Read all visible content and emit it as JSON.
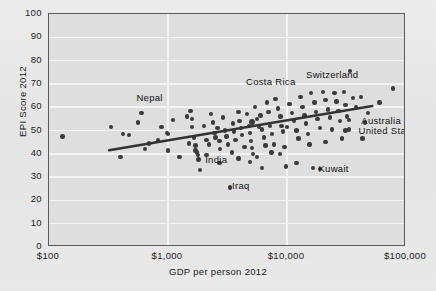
{
  "chart_data": {
    "type": "scatter",
    "title": "",
    "xlabel": "GDP per person 2012",
    "ylabel": "EPI Score 2012",
    "xscale": "log",
    "xlim": [
      100,
      100000
    ],
    "ylim": [
      0,
      100
    ],
    "grid": true,
    "legend": "none",
    "xticks": [
      "$100",
      "$1,000",
      "$10,000",
      "$100,000"
    ],
    "xtick_values": [
      100,
      1000,
      10000,
      100000
    ],
    "yticks": [
      "0",
      "10",
      "20",
      "30",
      "40",
      "50",
      "60",
      "70",
      "80",
      "90",
      "100"
    ],
    "ytick_values": [
      0,
      10,
      20,
      30,
      40,
      50,
      60,
      70,
      80,
      90,
      100
    ],
    "trendline": {
      "x": [
        320,
        52000
      ],
      "y": [
        41.5,
        60.5
      ]
    },
    "annotations": [
      {
        "label": "Nepal",
        "x": 700,
        "y": 64,
        "align": "center"
      },
      {
        "label": "Costa Rica",
        "x": 7300,
        "y": 71,
        "align": "center"
      },
      {
        "label": "Switzerland",
        "x": 24000,
        "y": 74,
        "align": "center"
      },
      {
        "label": "Australia",
        "x": 39000,
        "y": 54,
        "align": "left"
      },
      {
        "label": "United States",
        "x": 37000,
        "y": 50,
        "align": "left"
      },
      {
        "label": "India",
        "x": 1900,
        "y": 37.5,
        "align": "left"
      },
      {
        "label": "Iraq",
        "x": 3200,
        "y": 26,
        "align": "left"
      },
      {
        "label": "Kuwait",
        "x": 17000,
        "y": 33.5,
        "align": "left"
      }
    ],
    "points": [
      {
        "x": 130,
        "y": 47.5
      },
      {
        "x": 330,
        "y": 51.5
      },
      {
        "x": 420,
        "y": 48.5
      },
      {
        "x": 470,
        "y": 48.0
      },
      {
        "x": 560,
        "y": 53.5
      },
      {
        "x": 600,
        "y": 57.5
      },
      {
        "x": 400,
        "y": 38.5
      },
      {
        "x": 640,
        "y": 42.0
      },
      {
        "x": 690,
        "y": 44.5
      },
      {
        "x": 880,
        "y": 51.5
      },
      {
        "x": 980,
        "y": 49.0
      },
      {
        "x": 1000,
        "y": 48.5
      },
      {
        "x": 1000,
        "y": 41.5
      },
      {
        "x": 1100,
        "y": 54.5
      },
      {
        "x": 1250,
        "y": 38.5
      },
      {
        "x": 1500,
        "y": 44.5
      },
      {
        "x": 1550,
        "y": 58.5
      },
      {
        "x": 1600,
        "y": 55.0
      },
      {
        "x": 1600,
        "y": 51.5
      },
      {
        "x": 1650,
        "y": 47.0
      },
      {
        "x": 1700,
        "y": 43.5
      },
      {
        "x": 1700,
        "y": 41.5
      },
      {
        "x": 1750,
        "y": 40.5
      },
      {
        "x": 1780,
        "y": 39.5
      },
      {
        "x": 1800,
        "y": 37.5
      },
      {
        "x": 1850,
        "y": 33.0
      },
      {
        "x": 2000,
        "y": 52.0
      },
      {
        "x": 2100,
        "y": 46.0
      },
      {
        "x": 2200,
        "y": 44.0
      },
      {
        "x": 2300,
        "y": 57.0
      },
      {
        "x": 2400,
        "y": 53.5
      },
      {
        "x": 2450,
        "y": 49.0
      },
      {
        "x": 2500,
        "y": 47.0
      },
      {
        "x": 2600,
        "y": 51.0
      },
      {
        "x": 2700,
        "y": 45.5
      },
      {
        "x": 2750,
        "y": 42.0
      },
      {
        "x": 2900,
        "y": 55.5
      },
      {
        "x": 3000,
        "y": 50.0
      },
      {
        "x": 3100,
        "y": 47.5
      },
      {
        "x": 3200,
        "y": 44.0
      },
      {
        "x": 3300,
        "y": 25.5
      },
      {
        "x": 3500,
        "y": 53.0
      },
      {
        "x": 3600,
        "y": 49.5
      },
      {
        "x": 3700,
        "y": 46.0
      },
      {
        "x": 3900,
        "y": 58.0
      },
      {
        "x": 4000,
        "y": 54.0
      },
      {
        "x": 4100,
        "y": 51.0
      },
      {
        "x": 4200,
        "y": 48.0
      },
      {
        "x": 4400,
        "y": 43.0
      },
      {
        "x": 4600,
        "y": 57.0
      },
      {
        "x": 4800,
        "y": 52.0
      },
      {
        "x": 4900,
        "y": 49.0
      },
      {
        "x": 5000,
        "y": 45.5
      },
      {
        "x": 5200,
        "y": 40.0
      },
      {
        "x": 5400,
        "y": 60.0
      },
      {
        "x": 5600,
        "y": 55.0
      },
      {
        "x": 5800,
        "y": 51.5
      },
      {
        "x": 6000,
        "y": 56.5
      },
      {
        "x": 6200,
        "y": 50.5
      },
      {
        "x": 6400,
        "y": 47.0
      },
      {
        "x": 6600,
        "y": 43.5
      },
      {
        "x": 6800,
        "y": 62.0
      },
      {
        "x": 7000,
        "y": 58.0
      },
      {
        "x": 7200,
        "y": 52.0
      },
      {
        "x": 7500,
        "y": 48.5
      },
      {
        "x": 7800,
        "y": 44.0
      },
      {
        "x": 8000,
        "y": 63.5
      },
      {
        "x": 8400,
        "y": 59.5
      },
      {
        "x": 8800,
        "y": 56.0
      },
      {
        "x": 9000,
        "y": 52.0
      },
      {
        "x": 9200,
        "y": 49.5
      },
      {
        "x": 9500,
        "y": 43.0
      },
      {
        "x": 10000,
        "y": 51.5
      },
      {
        "x": 10500,
        "y": 61.5
      },
      {
        "x": 11000,
        "y": 57.5
      },
      {
        "x": 11500,
        "y": 54.0
      },
      {
        "x": 12000,
        "y": 50.0
      },
      {
        "x": 12500,
        "y": 46.5
      },
      {
        "x": 13000,
        "y": 64.5
      },
      {
        "x": 13500,
        "y": 60.0
      },
      {
        "x": 14000,
        "y": 56.5
      },
      {
        "x": 14500,
        "y": 53.0
      },
      {
        "x": 15000,
        "y": 48.5
      },
      {
        "x": 15500,
        "y": 44.0
      },
      {
        "x": 16000,
        "y": 66.0
      },
      {
        "x": 17000,
        "y": 62.0
      },
      {
        "x": 17500,
        "y": 58.0
      },
      {
        "x": 18000,
        "y": 55.0
      },
      {
        "x": 19000,
        "y": 51.0
      },
      {
        "x": 20000,
        "y": 66.5
      },
      {
        "x": 21000,
        "y": 63.0
      },
      {
        "x": 22000,
        "y": 59.0
      },
      {
        "x": 23000,
        "y": 55.5
      },
      {
        "x": 24000,
        "y": 50.5
      },
      {
        "x": 25000,
        "y": 66.0
      },
      {
        "x": 26000,
        "y": 62.5
      },
      {
        "x": 27000,
        "y": 58.5
      },
      {
        "x": 28000,
        "y": 54.0
      },
      {
        "x": 30000,
        "y": 66.5
      },
      {
        "x": 31000,
        "y": 61.0
      },
      {
        "x": 32000,
        "y": 56.0
      },
      {
        "x": 33000,
        "y": 50.5
      },
      {
        "x": 34000,
        "y": 75.5
      },
      {
        "x": 36000,
        "y": 64.0
      },
      {
        "x": 38000,
        "y": 60.0
      },
      {
        "x": 42000,
        "y": 64.5
      },
      {
        "x": 45000,
        "y": 53.5
      },
      {
        "x": 48000,
        "y": 57.5
      },
      {
        "x": 60000,
        "y": 62.0
      },
      {
        "x": 78000,
        "y": 68.0
      },
      {
        "x": 33000,
        "y": 54.5
      },
      {
        "x": 31000,
        "y": 50.0
      },
      {
        "x": 16500,
        "y": 34.0
      },
      {
        "x": 9800,
        "y": 34.5
      },
      {
        "x": 6200,
        "y": 34.0
      },
      {
        "x": 4900,
        "y": 36.5
      },
      {
        "x": 12000,
        "y": 36.0
      },
      {
        "x": 19000,
        "y": 33.5
      },
      {
        "x": 2700,
        "y": 36.0
      },
      {
        "x": 5600,
        "y": 38.5
      },
      {
        "x": 2100,
        "y": 39.5
      },
      {
        "x": 8700,
        "y": 40.0
      },
      {
        "x": 3900,
        "y": 38.0
      },
      {
        "x": 1450,
        "y": 56.0
      },
      {
        "x": 820,
        "y": 46.0
      },
      {
        "x": 29000,
        "y": 46.5
      },
      {
        "x": 43000,
        "y": 46.5
      },
      {
        "x": 7400,
        "y": 40.5
      },
      {
        "x": 5100,
        "y": 42.5
      },
      {
        "x": 21000,
        "y": 45.0
      },
      {
        "x": 3450,
        "y": 40.5
      }
    ],
    "highlight_point": {
      "x": 5100,
      "y": 53.5,
      "note": "enlarged marker near center"
    },
    "colors": {
      "background": "#e9e9e9",
      "plot_background": "#dedede",
      "gridline": "#f4f4f4",
      "frame": "#5a5a5a",
      "marker": "#3a3a3a",
      "trendline": "#333333",
      "text": "#1f1f1f"
    }
  }
}
